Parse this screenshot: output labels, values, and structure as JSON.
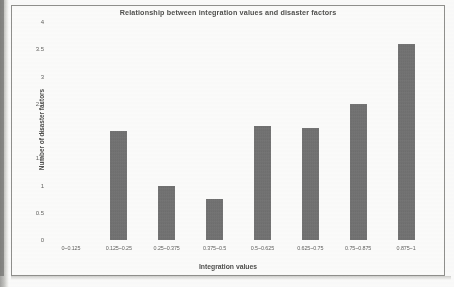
{
  "chart_data": {
    "type": "bar",
    "title": "Relationship between integration values and disaster factors",
    "xlabel": "Integration values",
    "ylabel": "Number of disaster factors",
    "categories": [
      "0~0.125",
      "0.125~0.25",
      "0.25~0.375",
      "0.375~0.5",
      "0.5~0.625",
      "0.625~0.75",
      "0.75~0.875",
      "0.875~1"
    ],
    "values": [
      0,
      2,
      1,
      0.75,
      2.1,
      2.05,
      2.5,
      3.6
    ],
    "ylim": [
      0,
      4
    ],
    "yticks": [
      0,
      0.5,
      1,
      1.5,
      2,
      2.5,
      3,
      3.5,
      4
    ],
    "ytick_labels": [
      "0",
      "0.5",
      "1",
      "1.5",
      "2",
      "2.5",
      "3",
      "3.5",
      "4"
    ],
    "grid": false,
    "legend": null,
    "bar_color": "#6b6b6b"
  }
}
